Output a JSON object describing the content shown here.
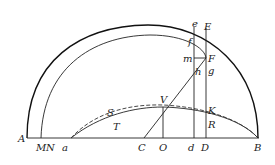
{
  "diagram": {
    "type": "geometric-figure",
    "labels": {
      "A": "A",
      "M": "M",
      "N": "N",
      "a": "a",
      "C": "C",
      "O": "O",
      "d": "d",
      "D": "D",
      "B": "B",
      "V": "V",
      "S": "S",
      "T": "T",
      "K": "K",
      "R": "R",
      "e": "e",
      "E": "E",
      "f": "f",
      "m": "m",
      "F": "F",
      "g": "g",
      "h": "h"
    },
    "elements": [
      "outer semicircular arc from A to B",
      "inner arc from M to B passing through f and F",
      "baseline A–B",
      "solid curve a–V–K–B (T, R)",
      "dashed curve a–S–V–B",
      "line C–F through h",
      "vertical line e–d",
      "vertical line E–D",
      "vertical line V–O",
      "horizontal segment m–F"
    ]
  }
}
